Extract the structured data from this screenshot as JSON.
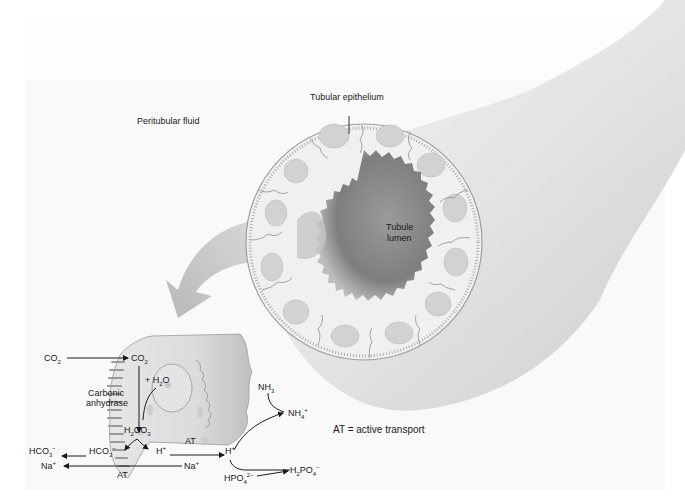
{
  "figure": {
    "labels": {
      "peritubular_fluid": "Peritubular fluid",
      "tubular_epithelium": "Tubular epithelium",
      "tubule_lumen_line1": "Tubule",
      "tubule_lumen_line2": "lumen",
      "legend_at": "AT = active transport"
    },
    "reactions": {
      "co2_out": {
        "base": "CO",
        "sub": "2"
      },
      "co2_in": {
        "base": "CO",
        "sub": "2"
      },
      "plus_h2o": {
        "pre": "+ H",
        "sub": "2",
        "post": "O"
      },
      "enzyme_line1": "Carbonic",
      "enzyme_line2": "anhydrase",
      "h2co3": {
        "pre": "H",
        "sub1": "2",
        "mid": "CO",
        "sub2": "3"
      },
      "hco3_out": {
        "base": "HCO",
        "sub": "3",
        "sup": "−"
      },
      "hco3_in": {
        "base": "HCO",
        "sub": "3",
        "sup": "−"
      },
      "h_in": {
        "base": "H",
        "sup": "+"
      },
      "h_lumen": {
        "base": "H",
        "sup": "+"
      },
      "at_upper": "AT",
      "at_lower": "AT",
      "na_out": {
        "base": "Na",
        "sup": "+"
      },
      "na_in": {
        "base": "Na",
        "sup": "+"
      },
      "nh3": {
        "base": "NH",
        "sub": "3"
      },
      "nh4": {
        "base": "NH",
        "sub": "4",
        "sup": "+"
      },
      "hpo4": {
        "base": "HPO",
        "sub": "4",
        "sup": "2−"
      },
      "h2po4": {
        "pre": "H",
        "sub1": "2",
        "mid": "PO",
        "sub2": "4",
        "sup": "−"
      }
    },
    "colors": {
      "background": "#ffffff",
      "tube_shade": "#d4d4d4",
      "lumen": "#8a8a8a",
      "epithelium": "#eeeeee",
      "nucleus": "#cfcfcf",
      "text": "#1a1a1a"
    }
  }
}
